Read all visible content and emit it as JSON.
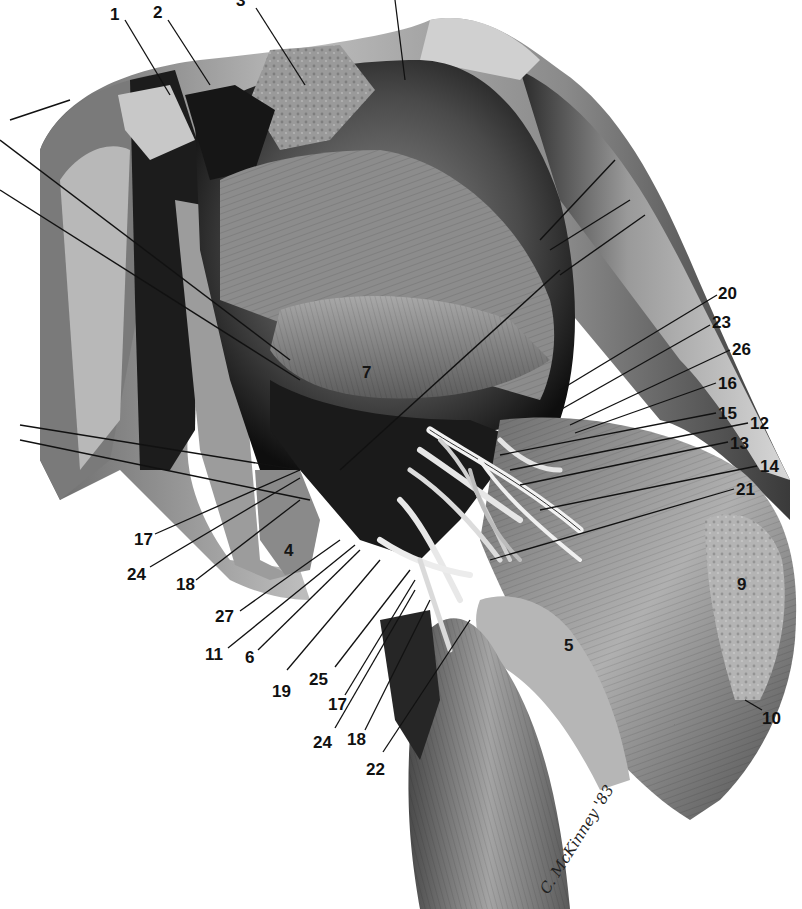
{
  "figure": {
    "type": "anatomical-illustration",
    "style": "grayscale pencil rendering",
    "signature": "C. McKinney '83",
    "labels": [
      {
        "id": "1",
        "text": "1",
        "x": 116,
        "y": 20
      },
      {
        "id": "2",
        "text": "2",
        "x": 160,
        "y": 18
      },
      {
        "id": "3",
        "text": "3",
        "x": 243,
        "y": 6
      },
      {
        "id": "7",
        "text": "7",
        "x": 365,
        "y": 375
      },
      {
        "id": "20",
        "text": "20",
        "x": 718,
        "y": 297
      },
      {
        "id": "23",
        "text": "23",
        "x": 712,
        "y": 326
      },
      {
        "id": "26",
        "text": "26",
        "x": 732,
        "y": 353
      },
      {
        "id": "16",
        "text": "16",
        "x": 718,
        "y": 388
      },
      {
        "id": "15",
        "text": "15",
        "x": 718,
        "y": 418
      },
      {
        "id": "12",
        "text": "12",
        "x": 750,
        "y": 428
      },
      {
        "id": "13",
        "text": "13",
        "x": 730,
        "y": 448
      },
      {
        "id": "14",
        "text": "14",
        "x": 760,
        "y": 470
      },
      {
        "id": "21",
        "text": "21",
        "x": 736,
        "y": 494
      },
      {
        "id": "17a",
        "text": "17",
        "x": 135,
        "y": 537
      },
      {
        "id": "24a",
        "text": "24",
        "x": 127,
        "y": 572
      },
      {
        "id": "18a",
        "text": "18",
        "x": 176,
        "y": 582
      },
      {
        "id": "4",
        "text": "4",
        "x": 284,
        "y": 553
      },
      {
        "id": "27",
        "text": "27",
        "x": 215,
        "y": 614
      },
      {
        "id": "11",
        "text": "11",
        "x": 205,
        "y": 652
      },
      {
        "id": "6",
        "text": "6",
        "x": 245,
        "y": 657
      },
      {
        "id": "19",
        "text": "19",
        "x": 272,
        "y": 688
      },
      {
        "id": "25",
        "text": "25",
        "x": 309,
        "y": 678
      },
      {
        "id": "17b",
        "text": "17",
        "x": 328,
        "y": 705
      },
      {
        "id": "24b",
        "text": "24",
        "x": 313,
        "y": 745
      },
      {
        "id": "18b",
        "text": "18",
        "x": 347,
        "y": 740
      },
      {
        "id": "22",
        "text": "22",
        "x": 366,
        "y": 768
      },
      {
        "id": "5",
        "text": "5",
        "x": 564,
        "y": 651
      },
      {
        "id": "9",
        "text": "9",
        "x": 737,
        "y": 590
      },
      {
        "id": "10",
        "text": "10",
        "x": 764,
        "y": 720
      }
    ]
  }
}
